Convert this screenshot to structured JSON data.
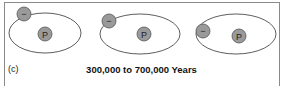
{
  "figure": {
    "panel_label": "(c)",
    "caption": "300,000 to 700,000 Years",
    "atoms": [
      {
        "id": "atom-1",
        "electron_symbol": "−",
        "nucleus_symbol": "P"
      },
      {
        "id": "atom-2",
        "electron_symbol": "−",
        "nucleus_symbol": "P"
      },
      {
        "id": "atom-3",
        "electron_symbol": "−",
        "nucleus_symbol": "P"
      }
    ],
    "colors": {
      "orbit": "#333333",
      "particle_fill": "#9a9a9a",
      "particle_stroke": "#555555",
      "border": "#8a8a8a"
    }
  }
}
